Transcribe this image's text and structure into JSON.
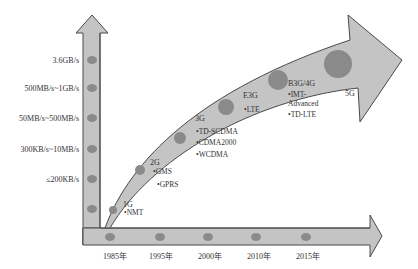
{
  "colors": {
    "arrow_fill": "#c4c4c4",
    "arrow_stroke": "#4a4a4a",
    "dot": "#8a8a8a",
    "text": "#333333"
  },
  "y_axis": {
    "labels": [
      "3.6GB/s",
      "500MB/s~1GB/s",
      "50MB/s~500MB/s",
      "300KB/s~10MB/s",
      "≤200KB/s"
    ]
  },
  "x_axis": {
    "labels": [
      "1985年",
      "1995年",
      "2000年",
      "2010年",
      "2015年"
    ]
  },
  "generations": [
    {
      "name": "1G",
      "techs": [
        "•NMT"
      ]
    },
    {
      "name": "2G",
      "techs": [
        "•GMS",
        "•GPRS"
      ]
    },
    {
      "name": "3G",
      "techs": [
        "•TD-SCDMA",
        "•CDMA2000",
        "•WCDMA"
      ]
    },
    {
      "name": "E3G",
      "techs": [
        "•LTE"
      ]
    },
    {
      "name": "B3G/4G",
      "techs": [
        "•IMT-",
        "Advanced",
        "•TD-LTE"
      ]
    },
    {
      "name": "5G",
      "techs": []
    }
  ]
}
